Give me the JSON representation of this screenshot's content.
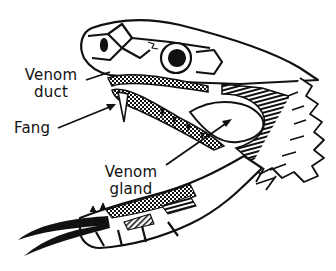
{
  "diagram": {
    "labels": [
      {
        "id": "venom-duct",
        "line1": "Venom",
        "line2": "duct"
      },
      {
        "id": "fang",
        "line1": "Fang"
      },
      {
        "id": "venom-gland",
        "line1": "Venom",
        "line2": "gland"
      }
    ],
    "colors": {
      "ink": "#111111",
      "background": "#ffffff"
    }
  }
}
